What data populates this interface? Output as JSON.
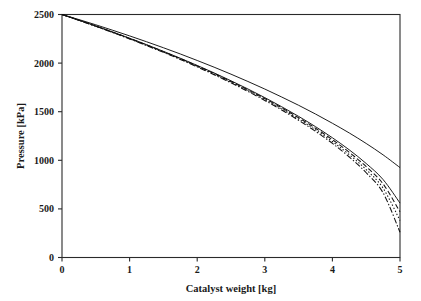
{
  "chart_data": {
    "type": "line",
    "title": "",
    "xlabel": "Catalyst weight [kg]",
    "ylabel": "Pressure [kPa]",
    "xlim": [
      0,
      5
    ],
    "ylim": [
      0,
      2500
    ],
    "xticks": [
      "0",
      "1",
      "2",
      "3",
      "4",
      "5"
    ],
    "xtick_values": [
      0,
      1,
      2,
      3,
      4,
      5
    ],
    "yticks": [
      "0",
      "500",
      "1000",
      "1500",
      "2000",
      "2500"
    ],
    "ytick_values": [
      0,
      500,
      1000,
      1500,
      2000,
      2500
    ],
    "grid": false,
    "legend": false,
    "legend_position": "none",
    "x": [
      0,
      0.25,
      0.5,
      0.75,
      1,
      1.25,
      1.5,
      1.75,
      2,
      2.25,
      2.5,
      2.75,
      3,
      3.25,
      3.5,
      3.75,
      4,
      4.25,
      4.5,
      4.75,
      5
    ],
    "series": [
      {
        "name": "upper-curve",
        "style": "solid",
        "color": "#111111",
        "values": [
          2500,
          2448,
          2394,
          2338,
          2280,
          2220,
          2158,
          2094,
          2027,
          1958,
          1886,
          1811,
          1733,
          1651,
          1566,
          1476,
          1381,
          1281,
          1173,
          1056,
          925
        ]
      },
      {
        "name": "lower-curve-solid",
        "style": "solid",
        "color": "#111111",
        "values": [
          2500,
          2442,
          2382,
          2320,
          2256,
          2190,
          2121,
          2050,
          1976,
          1899,
          1818,
          1734,
          1645,
          1551,
          1452,
          1346,
          1232,
          1107,
          967,
          802,
          560
        ]
      },
      {
        "name": "lower-curve-dashed",
        "style": "dashed",
        "color": "#111111",
        "values": [
          2500,
          2441,
          2381,
          2318,
          2254,
          2187,
          2118,
          2046,
          1971,
          1893,
          1811,
          1725,
          1635,
          1540,
          1438,
          1330,
          1212,
          1082,
          935,
          757,
          470
        ]
      },
      {
        "name": "lower-curve-dotted",
        "style": "dotted",
        "color": "#111111",
        "values": [
          2500,
          2440,
          2379,
          2316,
          2251,
          2184,
          2114,
          2042,
          1966,
          1887,
          1804,
          1717,
          1626,
          1529,
          1425,
          1314,
          1193,
          1058,
          904,
          713,
          380
        ]
      },
      {
        "name": "lower-curve-dashdot",
        "style": "dashdot",
        "color": "#111111",
        "values": [
          2500,
          2440,
          2378,
          2315,
          2249,
          2181,
          2111,
          2038,
          1961,
          1881,
          1797,
          1709,
          1616,
          1518,
          1412,
          1298,
          1174,
          1034,
          872,
          665,
          260
        ]
      }
    ]
  }
}
